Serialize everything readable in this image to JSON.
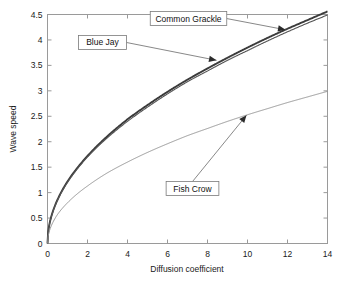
{
  "chart_data": {
    "type": "line",
    "title": "",
    "xlabel": "Diffusion coefficient",
    "ylabel": "Wave speed",
    "xlim": [
      0,
      14
    ],
    "ylim": [
      0,
      4.5
    ],
    "xticks": [
      "0",
      "2",
      "4",
      "6",
      "8",
      "10",
      "12",
      "14"
    ],
    "xtick_values": [
      0,
      2,
      4,
      6,
      8,
      10,
      12,
      14
    ],
    "yticks": [
      "0",
      "0.5",
      "1",
      "1.5",
      "2",
      "2.5",
      "3",
      "3.5",
      "4",
      "4.5"
    ],
    "ytick_values": [
      0,
      0.5,
      1,
      1.5,
      2,
      2.5,
      3,
      3.5,
      4,
      4.5
    ],
    "grid": false,
    "legend_position": "none",
    "series": [
      {
        "name": "Common Grackle",
        "color": "#3b3b3b",
        "x": [
          0,
          0.25,
          0.5,
          1,
          1.5,
          2,
          3,
          4,
          5,
          6,
          7,
          8,
          9,
          10,
          11,
          12,
          13,
          14
        ],
        "values": [
          0,
          0.61,
          0.86,
          1.22,
          1.49,
          1.72,
          2.11,
          2.44,
          2.72,
          2.98,
          3.22,
          3.44,
          3.65,
          3.85,
          4.04,
          4.22,
          4.39,
          4.56
        ]
      },
      {
        "name": "Blue Jay",
        "color": "#555555",
        "x": [
          0,
          0.25,
          0.5,
          1,
          1.5,
          2,
          3,
          4,
          5,
          6,
          7,
          8,
          9,
          10,
          11,
          12,
          13,
          14
        ],
        "values": [
          0,
          0.6,
          0.85,
          1.2,
          1.47,
          1.7,
          2.08,
          2.4,
          2.68,
          2.94,
          3.18,
          3.39,
          3.6,
          3.79,
          3.98,
          4.16,
          4.33,
          4.49
        ]
      },
      {
        "name": "Fish Crow",
        "color": "#8c8c8c",
        "x": [
          0,
          0.25,
          0.5,
          1,
          1.5,
          2,
          3,
          4,
          5,
          6,
          7,
          8,
          9,
          10,
          11,
          12,
          13,
          14
        ],
        "values": [
          0,
          0.4,
          0.57,
          0.8,
          0.98,
          1.13,
          1.39,
          1.6,
          1.79,
          1.96,
          2.12,
          2.26,
          2.4,
          2.53,
          2.65,
          2.77,
          2.88,
          2.99
        ]
      }
    ],
    "annotations": [
      {
        "label": "Common Grackle",
        "target_x": 11.9,
        "target_y": 4.2,
        "box_x": 7.05,
        "box_y": 4.42
      },
      {
        "label": "Blue Jay",
        "target_x": 8.45,
        "target_y": 3.6,
        "box_x": 2.75,
        "box_y": 3.95
      },
      {
        "label": "Fish Crow",
        "target_x": 9.95,
        "target_y": 2.52,
        "box_x": 7.25,
        "box_y": 1.08
      }
    ]
  }
}
